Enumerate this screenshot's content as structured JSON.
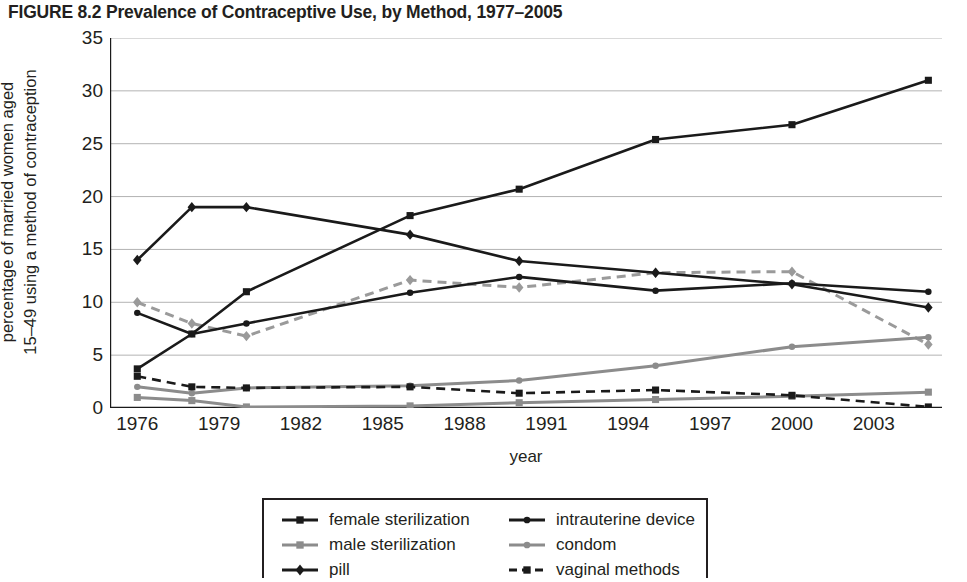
{
  "figure": {
    "title": "FIGURE 8.2 Prevalence of Contraceptive Use, by Method, 1977–2005"
  },
  "axis": {
    "ylabel_line1": "percentage of married women aged",
    "ylabel_line2": "15–49 using a method of contraception",
    "xlabel": "year",
    "yticks": [
      "0",
      "5",
      "10",
      "15",
      "20",
      "25",
      "30",
      "35"
    ],
    "xticks": [
      "1976",
      "1979",
      "1982",
      "1985",
      "1988",
      "1991",
      "1994",
      "1997",
      "2000",
      "2003"
    ]
  },
  "legend": {
    "left": [
      {
        "label": "female sterilization",
        "marker": "square",
        "color": "#1a1a1a",
        "dash": "solid"
      },
      {
        "label": "male sterilization",
        "marker": "square",
        "color": "#8c8c8c",
        "dash": "solid"
      },
      {
        "label": "pill",
        "marker": "diamond",
        "color": "#1a1a1a",
        "dash": "solid"
      }
    ],
    "right": [
      {
        "label": "intrauterine device",
        "marker": "circle",
        "color": "#1a1a1a",
        "dash": "solid"
      },
      {
        "label": "condom",
        "marker": "circle",
        "color": "#8c8c8c",
        "dash": "solid"
      },
      {
        "label": "vaginal methods",
        "marker": "square",
        "color": "#1a1a1a",
        "dash": "dashed"
      }
    ]
  },
  "chart_data": {
    "type": "line",
    "title": "FIGURE 8.2 Prevalence of Contraceptive Use, by Method, 1977–2005",
    "xlabel": "year",
    "ylabel": "percentage of married women aged 15–49 using a method of contraception",
    "xlim": [
      1975,
      2005.5
    ],
    "ylim": [
      0,
      35
    ],
    "yticks": [
      0,
      5,
      10,
      15,
      20,
      25,
      30,
      35
    ],
    "xticks": [
      1976,
      1979,
      1982,
      1985,
      1988,
      1991,
      1994,
      1997,
      2000,
      2003
    ],
    "grid": "horizontal",
    "legend_position": "below",
    "x": [
      1976,
      1978,
      1980,
      1986,
      1990,
      1995,
      2000,
      2005
    ],
    "series": [
      {
        "name": "female sterilization",
        "color": "#1a1a1a",
        "marker": "square",
        "dash": "solid",
        "values": [
          3.7,
          7.0,
          11.0,
          18.2,
          20.7,
          25.4,
          26.8,
          31.0
        ]
      },
      {
        "name": "male sterilization",
        "color": "#8c8c8c",
        "marker": "square",
        "dash": "solid",
        "values": [
          1.0,
          0.7,
          0.1,
          0.2,
          0.5,
          0.8,
          1.1,
          1.5
        ]
      },
      {
        "name": "pill",
        "color": "#1a1a1a",
        "marker": "diamond",
        "dash": "solid",
        "values": [
          14.0,
          19.0,
          19.0,
          16.4,
          13.9,
          12.8,
          11.7,
          9.5
        ]
      },
      {
        "name": "intrauterine device",
        "color": "#1a1a1a",
        "marker": "circle",
        "dash": "solid",
        "values": [
          9.0,
          7.0,
          8.0,
          10.9,
          12.4,
          11.1,
          11.8,
          11.0
        ]
      },
      {
        "name": "condom",
        "color": "#8c8c8c",
        "marker": "circle",
        "dash": "solid",
        "values": [
          2.0,
          1.4,
          1.9,
          2.1,
          2.6,
          4.0,
          5.8,
          6.7
        ]
      },
      {
        "name": "vaginal methods",
        "color": "#1a1a1a",
        "marker": "square",
        "dash": "dashed",
        "values": [
          3.0,
          2.0,
          1.9,
          2.0,
          1.4,
          1.7,
          1.2,
          0.1
        ]
      },
      {
        "name": "condom (dashed gray)",
        "color": "#9a9a9a",
        "marker": "diamond",
        "dash": "dashed",
        "values": [
          10.0,
          8.0,
          6.8,
          12.1,
          11.4,
          12.8,
          12.9,
          6.0
        ]
      }
    ]
  }
}
